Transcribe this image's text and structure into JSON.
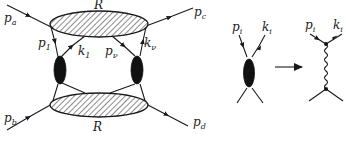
{
  "diagram": {
    "left": {
      "upper_blob_label": "R",
      "lower_blob_label": "R",
      "external_legs": [
        {
          "name": "p",
          "sub": "a"
        },
        {
          "name": "p",
          "sub": "b"
        },
        {
          "name": "p",
          "sub": "c"
        },
        {
          "name": "p",
          "sub": "d"
        }
      ],
      "internal_legs": [
        {
          "name": "p",
          "sub": "1"
        },
        {
          "name": "k",
          "sub": "1"
        },
        {
          "name": "p",
          "sub": "ν"
        },
        {
          "name": "k",
          "sub": "ν"
        }
      ]
    },
    "middle": {
      "legs": [
        {
          "name": "p",
          "sub": "i"
        },
        {
          "name": "k",
          "sub": "i"
        }
      ]
    },
    "arrow_icon": "right-arrow",
    "right": {
      "legs": [
        {
          "name": "p",
          "sub": "i"
        },
        {
          "name": "k",
          "sub": "i"
        }
      ],
      "propagator": "wavy-line"
    }
  }
}
